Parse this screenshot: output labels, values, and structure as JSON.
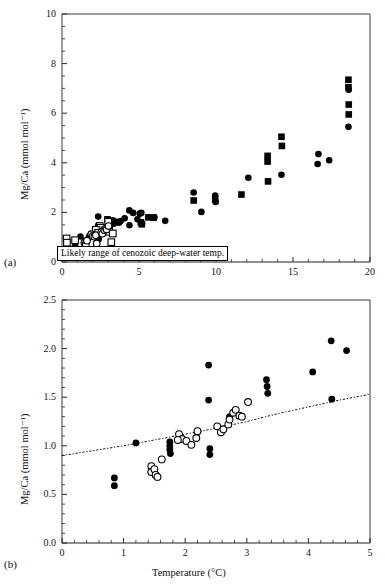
{
  "figure": {
    "panel_a_label": "(a)",
    "panel_b_label": "(b)",
    "annotation_text": "Likely range of cenozoic deep-water temp."
  },
  "chart_data": [
    {
      "type": "scatter",
      "panel": "(a)",
      "title": "",
      "xlabel": "",
      "ylabel": "Mg/Ca (mmol mol⁻¹)",
      "xlim": [
        0,
        20
      ],
      "ylim": [
        0,
        10
      ],
      "xticks": [
        0,
        5,
        10,
        15,
        20
      ],
      "yticks": [
        0,
        2,
        4,
        6,
        8,
        10
      ],
      "xticklabels": [
        "0",
        "5",
        "10",
        "15",
        "20"
      ],
      "yticklabels": [
        "0",
        "2",
        "4",
        "6",
        "8",
        "10"
      ],
      "minor_ticks": true,
      "grid": false,
      "legend": "none",
      "annotations": [
        {
          "text": "Likely range of cenozoic deep-water temp.",
          "x_range": [
            0.35,
            12.3
          ],
          "y": 0.45
        }
      ],
      "series": [
        {
          "name": "filled-circle",
          "marker": "filled-circle",
          "points": [
            [
              0.85,
              0.67
            ],
            [
              0.85,
              0.59
            ],
            [
              1.2,
              1.03
            ],
            [
              1.55,
              0.86
            ],
            [
              1.75,
              1.0
            ],
            [
              1.75,
              0.98
            ],
            [
              1.78,
              1.05
            ],
            [
              1.9,
              1.12
            ],
            [
              2.05,
              1.06
            ],
            [
              2.15,
              1.09
            ],
            [
              2.25,
              1.15
            ],
            [
              2.35,
              1.83
            ],
            [
              2.35,
              1.47
            ],
            [
              2.38,
              0.97
            ],
            [
              2.38,
              0.92
            ],
            [
              2.55,
              1.2
            ],
            [
              2.62,
              1.14
            ],
            [
              2.72,
              1.3
            ],
            [
              2.78,
              1.27
            ],
            [
              2.9,
              1.31
            ],
            [
              3.05,
              1.45
            ],
            [
              3.3,
              1.68
            ],
            [
              3.32,
              1.61
            ],
            [
              3.33,
              1.54
            ],
            [
              4.07,
              1.76
            ],
            [
              4.37,
              2.08
            ],
            [
              4.38,
              1.48
            ],
            [
              4.62,
              1.98
            ],
            [
              3.55,
              1.62
            ],
            [
              3.7,
              1.58
            ],
            [
              3.8,
              1.65
            ],
            [
              4.9,
              1.72
            ],
            [
              5.05,
              1.95
            ],
            [
              5.15,
              1.98
            ],
            [
              5.2,
              1.55
            ],
            [
              6.0,
              1.8
            ],
            [
              6.7,
              1.66
            ],
            [
              8.55,
              2.8
            ],
            [
              9.05,
              2.02
            ],
            [
              9.95,
              2.68
            ],
            [
              9.98,
              2.42
            ],
            [
              12.1,
              3.4
            ],
            [
              14.25,
              3.52
            ],
            [
              16.6,
              3.95
            ],
            [
              16.65,
              4.35
            ],
            [
              17.35,
              4.1
            ],
            [
              18.6,
              5.45
            ],
            [
              18.62,
              6.95
            ]
          ]
        },
        {
          "name": "filled-square",
          "marker": "filled-square",
          "points": [
            [
              2.95,
              1.72
            ],
            [
              3.1,
              1.45
            ],
            [
              3.25,
              1.55
            ],
            [
              3.4,
              1.6
            ],
            [
              5.12,
              1.6
            ],
            [
              5.18,
              1.52
            ],
            [
              5.6,
              1.8
            ],
            [
              5.95,
              1.79
            ],
            [
              8.55,
              2.48
            ],
            [
              9.95,
              2.52
            ],
            [
              11.65,
              2.72
            ],
            [
              13.35,
              4.28
            ],
            [
              13.35,
              4.05
            ],
            [
              13.38,
              3.25
            ],
            [
              14.25,
              5.05
            ],
            [
              14.28,
              4.68
            ],
            [
              18.6,
              7.35
            ],
            [
              18.6,
              7.05
            ],
            [
              18.62,
              6.35
            ],
            [
              18.62,
              5.95
            ]
          ]
        },
        {
          "name": "open-square",
          "marker": "open-square",
          "points": [
            [
              0.3,
              0.95
            ],
            [
              0.32,
              0.78
            ],
            [
              0.85,
              0.88
            ],
            [
              2.45,
              1.45
            ],
            [
              2.5,
              1.38
            ],
            [
              2.75,
              1.28
            ],
            [
              3.0,
              1.62
            ],
            [
              3.05,
              1.22
            ],
            [
              3.2,
              0.8
            ],
            [
              3.3,
              1.15
            ],
            [
              2.2,
              1.3
            ],
            [
              2.35,
              1.18
            ]
          ]
        },
        {
          "name": "open-circle",
          "marker": "open-circle",
          "points": [
            [
              1.45,
              0.78
            ],
            [
              1.52,
              0.72
            ],
            [
              1.55,
              0.68
            ],
            [
              1.62,
              0.86
            ],
            [
              1.9,
              1.12
            ],
            [
              2.0,
              1.05
            ],
            [
              2.1,
              1.02
            ],
            [
              2.2,
              1.08
            ],
            [
              2.55,
              1.2
            ],
            [
              2.62,
              1.14
            ],
            [
              2.75,
              1.28
            ],
            [
              2.85,
              1.36
            ],
            [
              2.9,
              1.31
            ],
            [
              3.02,
              1.45
            ],
            [
              2.25,
              0.75
            ]
          ]
        }
      ]
    },
    {
      "type": "scatter",
      "panel": "(b)",
      "title": "",
      "xlabel": "Temperature (°C)",
      "ylabel": "Mg/Ca (mmol mol⁻¹)",
      "xlim": [
        0,
        5
      ],
      "ylim": [
        0.0,
        2.5
      ],
      "xticks": [
        0,
        1,
        2,
        3,
        4,
        5
      ],
      "yticks": [
        0.0,
        0.5,
        1.0,
        1.5,
        2.0,
        2.5
      ],
      "xticklabels": [
        "0",
        "1",
        "2",
        "3",
        "4",
        "5"
      ],
      "yticklabels": [
        "0.0",
        "0.5",
        "1.0",
        "1.5",
        "2.0",
        "2.5"
      ],
      "minor_ticks": true,
      "grid": false,
      "legend": "none",
      "trendline": {
        "style": "dash-dot",
        "points": [
          [
            0.0,
            0.9
          ],
          [
            0.5,
            0.95
          ],
          [
            1.0,
            1.0
          ],
          [
            1.5,
            1.06
          ],
          [
            2.0,
            1.12
          ],
          [
            2.5,
            1.18
          ],
          [
            3.0,
            1.25
          ],
          [
            3.5,
            1.33
          ],
          [
            4.0,
            1.4
          ],
          [
            4.5,
            1.47
          ],
          [
            5.0,
            1.53
          ]
        ]
      },
      "series": [
        {
          "name": "filled-circle",
          "marker": "filled-circle",
          "points": [
            [
              0.85,
              0.67
            ],
            [
              0.85,
              0.59
            ],
            [
              1.2,
              1.03
            ],
            [
              1.75,
              1.04
            ],
            [
              1.75,
              1.0
            ],
            [
              1.75,
              0.96
            ],
            [
              1.76,
              0.92
            ],
            [
              2.38,
              1.83
            ],
            [
              2.38,
              1.47
            ],
            [
              2.4,
              0.97
            ],
            [
              2.4,
              0.91
            ],
            [
              2.72,
              1.3
            ],
            [
              3.32,
              1.68
            ],
            [
              3.33,
              1.61
            ],
            [
              3.34,
              1.54
            ],
            [
              4.07,
              1.76
            ],
            [
              4.37,
              2.08
            ],
            [
              4.38,
              1.48
            ],
            [
              4.62,
              1.98
            ]
          ]
        },
        {
          "name": "open-circle",
          "marker": "open-circle",
          "points": [
            [
              1.45,
              0.79
            ],
            [
              1.45,
              0.73
            ],
            [
              1.5,
              0.76
            ],
            [
              1.52,
              0.7
            ],
            [
              1.55,
              0.68
            ],
            [
              1.62,
              0.86
            ],
            [
              1.9,
              1.12
            ],
            [
              1.95,
              1.07
            ],
            [
              2.02,
              1.05
            ],
            [
              2.1,
              1.01
            ],
            [
              2.18,
              1.08
            ],
            [
              2.2,
              1.15
            ],
            [
              2.52,
              1.2
            ],
            [
              2.58,
              1.14
            ],
            [
              2.62,
              1.17
            ],
            [
              2.7,
              1.22
            ],
            [
              2.78,
              1.34
            ],
            [
              2.82,
              1.37
            ],
            [
              2.88,
              1.31
            ],
            [
              2.92,
              1.3
            ],
            [
              3.02,
              1.45
            ],
            [
              2.72,
              1.27
            ],
            [
              1.88,
              1.06
            ]
          ]
        }
      ]
    }
  ]
}
